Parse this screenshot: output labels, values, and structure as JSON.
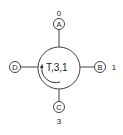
{
  "diagram": {
    "type": "node-connector",
    "center_node": {
      "label": "T,3,1",
      "rotation_arrow": "counter-clockwise"
    },
    "ports": [
      {
        "id": "A",
        "position": "top",
        "value": "0"
      },
      {
        "id": "B",
        "position": "right",
        "value": "1"
      },
      {
        "id": "C",
        "position": "bottom",
        "value": "3"
      },
      {
        "id": "D",
        "position": "left",
        "value": ""
      }
    ],
    "colors": {
      "stroke": "#333333",
      "text": "#222222",
      "background": "#ffffff"
    }
  }
}
